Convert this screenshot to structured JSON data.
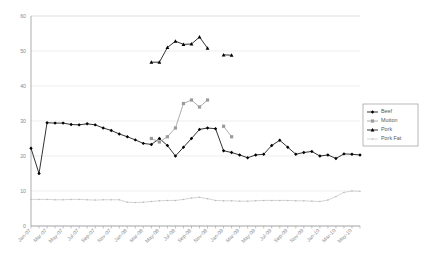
{
  "chart_data": {
    "type": "line",
    "title": "",
    "xlabel": "",
    "ylabel": "",
    "ylim": [
      0,
      60
    ],
    "yticks": [
      0,
      10,
      20,
      30,
      40,
      50,
      60
    ],
    "grid": true,
    "legend_position": "right",
    "categories": [
      "Jan-07",
      "Feb-07",
      "Mar-07",
      "Apr-07",
      "May-07",
      "Jun-07",
      "Jul-07",
      "Aug-07",
      "Sep-07",
      "Oct-07",
      "Nov-07",
      "Dec-07",
      "Jan-08",
      "Feb-08",
      "Mar-08",
      "Apr-08",
      "May-08",
      "Jun-08",
      "Jul-08",
      "Aug-08",
      "Sep-08",
      "Oct-08",
      "Nov-08",
      "Dec-08",
      "Jan-09",
      "Feb-09",
      "Mar-09",
      "Apr-09",
      "May-09",
      "Jun-09",
      "Jul-09",
      "Aug-09",
      "Sep-09",
      "Oct-09",
      "Nov-09",
      "Dec-09",
      "Jan-10",
      "Feb-10",
      "Mar-10",
      "Apr-10",
      "May-10",
      "Jun-10"
    ],
    "tick_labels": [
      "Jan-07",
      "Mar-07",
      "May-07",
      "Jul-07",
      "Sep-07",
      "Nov-07",
      "Jan-08",
      "Mar-08",
      "May-08",
      "Jul-08",
      "Sep-08",
      "Nov-08",
      "Jan-09",
      "Mar-09",
      "May-09",
      "Jul-09",
      "Sep-09",
      "Nov-09",
      "Jan-10",
      "Mar-10",
      "May-10"
    ],
    "series": [
      {
        "name": "Beef",
        "color": "#000000",
        "marker": "diamond",
        "values": [
          22.2,
          15.0,
          29.5,
          29.4,
          29.4,
          29.0,
          28.9,
          29.2,
          28.9,
          28.0,
          27.3,
          26.3,
          25.5,
          24.6,
          23.6,
          23.3,
          25.0,
          23.0,
          20.0,
          22.5,
          25.0,
          27.6,
          28.0,
          27.8,
          21.5,
          21.0,
          20.3,
          19.5,
          20.3,
          20.5,
          23.0,
          24.5,
          22.5,
          20.5,
          21.0,
          21.3,
          20.0,
          20.3,
          19.3,
          20.6,
          20.5,
          20.3
        ]
      },
      {
        "name": "Mutton",
        "color": "#9a9a9a",
        "marker": "square",
        "values": [
          null,
          null,
          null,
          null,
          null,
          null,
          null,
          null,
          null,
          null,
          null,
          null,
          null,
          null,
          null,
          25.0,
          24.0,
          25.5,
          28.0,
          35.0,
          36.0,
          34.0,
          36.0,
          null,
          null,
          null,
          null,
          null,
          null,
          null,
          null,
          null,
          null,
          null,
          null,
          null,
          null,
          null,
          null,
          null,
          null,
          null
        ],
        "extra_points": [
          {
            "index": 24,
            "value": 28.5
          },
          {
            "index": 25,
            "value": 25.5
          }
        ]
      },
      {
        "name": "Pork",
        "color": "#000000",
        "marker": "triangle",
        "values": [
          null,
          null,
          null,
          null,
          null,
          null,
          null,
          null,
          null,
          null,
          null,
          null,
          null,
          null,
          null,
          46.8,
          46.8,
          51.0,
          52.8,
          51.9,
          52.0,
          54.0,
          50.8,
          null,
          null,
          null,
          null,
          null,
          null,
          null,
          null,
          null,
          null,
          null,
          null,
          null,
          null,
          null,
          null,
          null,
          null,
          null
        ],
        "extra_points": [
          {
            "index": 24,
            "value": 48.9
          },
          {
            "index": 25,
            "value": 48.8
          }
        ]
      },
      {
        "name": "Pork Fat",
        "color": "#b9b9b9",
        "marker": "dot",
        "values": [
          7.6,
          7.6,
          7.6,
          7.5,
          7.5,
          7.6,
          7.6,
          7.5,
          7.4,
          7.5,
          7.5,
          7.5,
          6.8,
          6.7,
          6.8,
          7.0,
          7.2,
          7.3,
          7.3,
          7.6,
          8.0,
          8.2,
          7.8,
          7.3,
          7.2,
          7.2,
          7.1,
          7.1,
          7.2,
          7.3,
          7.3,
          7.3,
          7.3,
          7.2,
          7.2,
          7.1,
          7.0,
          7.4,
          8.4,
          9.6,
          10.0,
          9.9
        ]
      }
    ]
  },
  "legend": {
    "items": [
      {
        "label": "Beef"
      },
      {
        "label": "Mutton"
      },
      {
        "label": "Pork"
      },
      {
        "label": "Pork Fat"
      }
    ]
  }
}
